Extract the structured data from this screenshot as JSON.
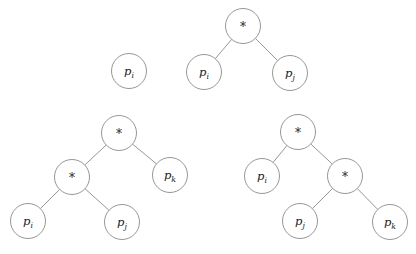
{
  "figure": {
    "width": 416,
    "height": 254,
    "background_color": "#ffffff",
    "stroke_color": "#8a8a8a",
    "text_color": "#1c1c1c",
    "node_radius": 17.5,
    "clipped_text_top": "",
    "operator_symbol": "*"
  },
  "trees": [
    {
      "id": "tree-single-leaf",
      "nodes": [
        {
          "id": "t1-n1",
          "kind": "leaf",
          "var": "p",
          "sub": "i",
          "cx": 129,
          "cy": 71
        }
      ],
      "edges": []
    },
    {
      "id": "tree-two-leaf-product",
      "nodes": [
        {
          "id": "t2-root",
          "kind": "operator",
          "label": "*",
          "cx": 243,
          "cy": 26
        },
        {
          "id": "t2-left",
          "kind": "leaf",
          "var": "p",
          "sub": "i",
          "cx": 204,
          "cy": 72
        },
        {
          "id": "t2-right",
          "kind": "leaf",
          "var": "p",
          "sub": "j",
          "cx": 290,
          "cy": 73
        }
      ],
      "edges": [
        {
          "from": "t2-root",
          "to": "t2-left"
        },
        {
          "from": "t2-root",
          "to": "t2-right"
        }
      ]
    },
    {
      "id": "tree-left-associative",
      "nodes": [
        {
          "id": "t3-root",
          "kind": "operator",
          "label": "*",
          "cx": 119,
          "cy": 133
        },
        {
          "id": "t3-inner",
          "kind": "operator",
          "label": "*",
          "cx": 72,
          "cy": 177
        },
        {
          "id": "t3-k",
          "kind": "leaf",
          "var": "p",
          "sub": "k",
          "cx": 170,
          "cy": 175
        },
        {
          "id": "t3-i",
          "kind": "leaf",
          "var": "p",
          "sub": "i",
          "cx": 28,
          "cy": 221
        },
        {
          "id": "t3-j",
          "kind": "leaf",
          "var": "p",
          "sub": "j",
          "cx": 122,
          "cy": 222
        }
      ],
      "edges": [
        {
          "from": "t3-root",
          "to": "t3-inner"
        },
        {
          "from": "t3-root",
          "to": "t3-k"
        },
        {
          "from": "t3-inner",
          "to": "t3-i"
        },
        {
          "from": "t3-inner",
          "to": "t3-j"
        }
      ]
    },
    {
      "id": "tree-right-associative",
      "nodes": [
        {
          "id": "t4-root",
          "kind": "operator",
          "label": "*",
          "cx": 298,
          "cy": 132
        },
        {
          "id": "t4-i",
          "kind": "leaf",
          "var": "p",
          "sub": "i",
          "cx": 262,
          "cy": 176
        },
        {
          "id": "t4-inner",
          "kind": "operator",
          "label": "*",
          "cx": 345,
          "cy": 176
        },
        {
          "id": "t4-j",
          "kind": "leaf",
          "var": "p",
          "sub": "j",
          "cx": 300,
          "cy": 221
        },
        {
          "id": "t4-k",
          "kind": "leaf",
          "var": "p",
          "sub": "k",
          "cx": 390,
          "cy": 222
        }
      ],
      "edges": [
        {
          "from": "t4-root",
          "to": "t4-i"
        },
        {
          "from": "t4-root",
          "to": "t4-inner"
        },
        {
          "from": "t4-inner",
          "to": "t4-j"
        },
        {
          "from": "t4-inner",
          "to": "t4-k"
        }
      ]
    }
  ]
}
